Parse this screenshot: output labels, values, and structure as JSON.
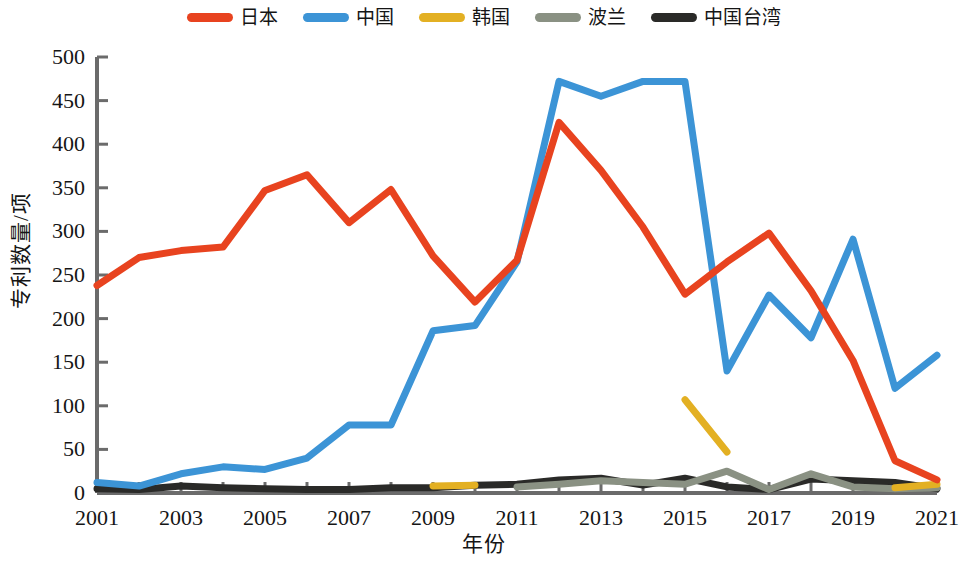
{
  "chart_data": {
    "type": "line",
    "title": "",
    "xlabel": "年份",
    "ylabel": "专利数量/项",
    "xlim": [
      2001,
      2021
    ],
    "ylim": [
      0,
      500
    ],
    "grid": false,
    "legend_position": "top-center",
    "x": [
      2001,
      2002,
      2003,
      2004,
      2005,
      2006,
      2007,
      2008,
      2009,
      2010,
      2011,
      2012,
      2013,
      2014,
      2015,
      2016,
      2017,
      2018,
      2019,
      2020,
      2021
    ],
    "xticks": [
      "2001",
      "2003",
      "2005",
      "2007",
      "2009",
      "2011",
      "2013",
      "2015",
      "2017",
      "2019",
      "2021"
    ],
    "yticks": [
      "0",
      "50",
      "100",
      "150",
      "200",
      "250",
      "300",
      "350",
      "400",
      "450",
      "500"
    ],
    "series": [
      {
        "name": "日本",
        "color": "#E8431F",
        "values": [
          238,
          270,
          278,
          282,
          347,
          365,
          310,
          348,
          272,
          219,
          267,
          425,
          370,
          305,
          228,
          265,
          298,
          232,
          152,
          37,
          15
        ]
      },
      {
        "name": "中国",
        "color": "#3C94D6",
        "values": [
          12,
          8,
          22,
          30,
          27,
          40,
          78,
          78,
          186,
          192,
          265,
          472,
          455,
          472,
          472,
          140,
          227,
          178,
          291,
          120,
          158
        ]
      },
      {
        "name": "韩国",
        "color": "#E3B023",
        "values": [
          null,
          null,
          null,
          null,
          null,
          null,
          null,
          null,
          8,
          9,
          null,
          null,
          null,
          null,
          107,
          47,
          null,
          null,
          null,
          6,
          10
        ]
      },
      {
        "name": "波兰",
        "color": "#8A9183",
        "values": [
          null,
          null,
          null,
          null,
          null,
          null,
          null,
          null,
          null,
          null,
          7,
          10,
          14,
          12,
          10,
          25,
          4,
          22,
          7,
          5,
          6
        ]
      },
      {
        "name": "中国台湾",
        "color": "#2A2A28",
        "values": [
          5,
          4,
          8,
          6,
          5,
          4,
          4,
          6,
          6,
          9,
          10,
          15,
          17,
          9,
          17,
          7,
          4,
          16,
          14,
          12,
          5
        ]
      }
    ]
  },
  "legend": {
    "items": [
      {
        "label": "日本",
        "color": "#E8431F",
        "icon": "line-swatch-icon"
      },
      {
        "label": "中国",
        "color": "#3C94D6",
        "icon": "line-swatch-icon"
      },
      {
        "label": "韩国",
        "color": "#E3B023",
        "icon": "line-swatch-icon"
      },
      {
        "label": "波兰",
        "color": "#8A9183",
        "icon": "line-swatch-icon"
      },
      {
        "label": "中国台湾",
        "color": "#2A2A28",
        "icon": "line-swatch-icon"
      }
    ]
  },
  "axes": {
    "y_label": "专利数量/项",
    "x_label": "年份",
    "y_tick_labels": [
      "500",
      "450",
      "400",
      "350",
      "300",
      "250",
      "200",
      "150",
      "100",
      "50",
      "0"
    ],
    "x_tick_labels": [
      "2001",
      "2003",
      "2005",
      "2007",
      "2009",
      "2011",
      "2013",
      "2015",
      "2017",
      "2019",
      "2021"
    ],
    "axis_color": "#6B6B6B"
  }
}
